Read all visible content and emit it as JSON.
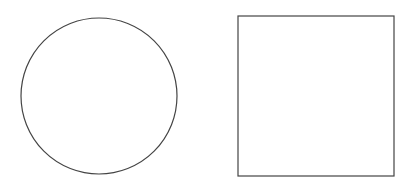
{
  "canvas": {
    "width": 413,
    "height": 191,
    "background": "#ffffff"
  },
  "shapes": [
    {
      "type": "circle",
      "cx": 99,
      "cy": 96,
      "r": 78,
      "stroke": "#444444",
      "stroke_width": 1.2,
      "fill": "none"
    },
    {
      "type": "rect",
      "x": 238,
      "y": 16,
      "width": 156,
      "height": 160,
      "stroke": "#444444",
      "stroke_width": 1.2,
      "fill": "none"
    }
  ]
}
